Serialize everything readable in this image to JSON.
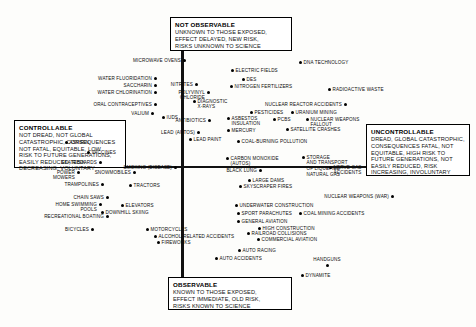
{
  "figure": {
    "type": "scatter",
    "title": "",
    "xlabel": "Controllable – Uncontrollable (Dread) factor",
    "ylabel": "Observable – Not Observable (Unknown) factor",
    "axes": {
      "vertical": "unknown-risk-axis",
      "horizontal": "dread-risk-axis"
    },
    "grid": false,
    "legend": false
  },
  "quadrant_labels": {
    "not_observable": {
      "title": "NOT OBSERVABLE",
      "body": "UNKNOWN TO THOSE EXPOSED,\nEFFECT DELAYED, NEW RISK,\nRISKS UNKNOWN TO SCIENCE"
    },
    "observable": {
      "title": "OBSERVABLE",
      "body": "KNOWN TO THOSE EXPOSED,\nEFFECT IMMEDIATE, OLD RISK,\nRISKS KNOWN TO SCIENCE"
    },
    "controllable": {
      "title": "CONTROLLABLE",
      "body": "NOT DREAD, NOT GLOBAL\nCATASTROPHIC, CONSEQUENCES\nNOT FATAL, EQUITABLE, LOW\nRISK TO FUTURE GENERATIONS,\nEASILY REDUCED, RISK\nDECREASING, VOLUNTARY"
    },
    "uncontrollable": {
      "title": "UNCONTROLLABLE",
      "body": "DREAD, GLOBAL CATASTROPHIC,\nCONSEQUENCES FATAL, NOT\nEQUITABLE, HIGH RISK TO\nFUTURE GENERATIONS, NOT\nEASILY REDUCED, RISK\nINCREASING, INVOLUNTARY"
    }
  },
  "chart_data": {
    "type": "scatter",
    "title": "",
    "xlabel": "Controllable → Uncontrollable (Dread)",
    "ylabel": "Observable → Not Observable (Unknown)",
    "xlim": [
      0,
      476
    ],
    "ylim": [
      0,
      327
    ],
    "points": [
      {
        "label": "MICROWAVE OVENS",
        "x": 184,
        "y": 60,
        "align": "right"
      },
      {
        "label": "WATER FLUORIDATION",
        "x": 155,
        "y": 78,
        "align": "right"
      },
      {
        "label": "SACCHARIN",
        "x": 155,
        "y": 85,
        "align": "right"
      },
      {
        "label": "WATER CHLORINATION",
        "x": 155,
        "y": 92,
        "align": "right"
      },
      {
        "label": "ORAL CONTRACEPTIVES",
        "x": 155,
        "y": 104,
        "align": "right"
      },
      {
        "label": "VALIUM",
        "x": 152,
        "y": 113,
        "align": "right"
      },
      {
        "label": "IUDS",
        "x": 163,
        "y": 117,
        "align": "left"
      },
      {
        "label": "NITRITES",
        "x": 196,
        "y": 84,
        "align": "right"
      },
      {
        "label": "POLYVINYL\nCHLORIDE",
        "x": 208,
        "y": 92,
        "align": "right"
      },
      {
        "label": "DIAGNOSTIC\nX-RAYS",
        "x": 194,
        "y": 101,
        "align": "left"
      },
      {
        "label": "ANTIBIOTICS",
        "x": 209,
        "y": 120,
        "align": "right"
      },
      {
        "label": "DNA TECHNOLOGY",
        "x": 300,
        "y": 62,
        "align": "left"
      },
      {
        "label": "ELECTRIC FIELDS",
        "x": 232,
        "y": 70,
        "align": "left"
      },
      {
        "label": "DES",
        "x": 243,
        "y": 79,
        "align": "left"
      },
      {
        "label": "NITROGEN FERTILIZERS",
        "x": 231,
        "y": 86,
        "align": "left"
      },
      {
        "label": "RADIOACTIVE WASTE",
        "x": 329,
        "y": 89,
        "align": "left"
      },
      {
        "label": "NUCLEAR REACTOR ACCIDENTS",
        "x": 345,
        "y": 104,
        "align": "right"
      },
      {
        "label": "PESTICIDES",
        "x": 251,
        "y": 112,
        "align": "left"
      },
      {
        "label": "URANIUM MINING",
        "x": 292,
        "y": 112,
        "align": "left"
      },
      {
        "label": "ASBESTOS\nINSULATION",
        "x": 228,
        "y": 118,
        "align": "left"
      },
      {
        "label": "PCBS",
        "x": 274,
        "y": 119,
        "align": "left"
      },
      {
        "label": "NUCLEAR WEAPONS\nFALLOUT",
        "x": 307,
        "y": 119,
        "align": "left"
      },
      {
        "label": "MERCURY",
        "x": 228,
        "y": 130,
        "align": "left"
      },
      {
        "label": "SATELLITE CRASHES",
        "x": 287,
        "y": 129,
        "align": "left"
      },
      {
        "label": "COAL-BURNING POLLUTION",
        "x": 238,
        "y": 141,
        "align": "left"
      },
      {
        "label": "LEAD (AUTOS)",
        "x": 198,
        "y": 132,
        "align": "right"
      },
      {
        "label": "LEAD PAINT",
        "x": 190,
        "y": 139,
        "align": "left"
      },
      {
        "label": "ASPIRIN",
        "x": 66,
        "y": 142,
        "align": "left"
      },
      {
        "label": "VACCINES",
        "x": 88,
        "y": 152,
        "align": "left"
      },
      {
        "label": "SKATEBOARDS",
        "x": 100,
        "y": 162,
        "align": "right"
      },
      {
        "label": "POWER\nMOWERS",
        "x": 78,
        "y": 172,
        "align": "right"
      },
      {
        "label": "SNOWMOBILES",
        "x": 134,
        "y": 172,
        "align": "right"
      },
      {
        "label": "SMOKING (DISEASE)",
        "x": 175,
        "y": 167,
        "align": "right"
      },
      {
        "label": "TRAMPOLINES",
        "x": 102,
        "y": 184,
        "align": "right"
      },
      {
        "label": "TRACTORS",
        "x": 130,
        "y": 185,
        "align": "left"
      },
      {
        "label": "CHAIN SAWS",
        "x": 107,
        "y": 197,
        "align": "right"
      },
      {
        "label": "HOME SWIMMING\nPOOLS",
        "x": 100,
        "y": 204,
        "align": "right"
      },
      {
        "label": "DOWNHILL SKIING",
        "x": 102,
        "y": 212,
        "align": "left"
      },
      {
        "label": "RECREATIONAL BOATING",
        "x": 107,
        "y": 216,
        "align": "right"
      },
      {
        "label": "ELEVATORS",
        "x": 122,
        "y": 205,
        "align": "left"
      },
      {
        "label": "BICYCLES",
        "x": 92,
        "y": 229,
        "align": "right"
      },
      {
        "label": "MOTORCYCLES",
        "x": 147,
        "y": 229,
        "align": "left"
      },
      {
        "label": "ALCOHOL-RELATED ACCIDENTS",
        "x": 155,
        "y": 236,
        "align": "left"
      },
      {
        "label": "FIREWORKS",
        "x": 158,
        "y": 242,
        "align": "left"
      },
      {
        "label": "CARBON MONOXIDE\n(AUTOS)",
        "x": 227,
        "y": 158,
        "align": "left"
      },
      {
        "label": "BLACK LUNG",
        "x": 260,
        "y": 170,
        "align": "right"
      },
      {
        "label": "LARGE DAMS",
        "x": 249,
        "y": 180,
        "align": "left"
      },
      {
        "label": "SKYSCRAPER FIRES",
        "x": 240,
        "y": 186,
        "align": "left"
      },
      {
        "label": "STORAGE\nAND TRANSPORT\nOF LIQUEFIED\nNATURAL GAS",
        "x": 303,
        "y": 157,
        "align": "left"
      },
      {
        "label": "NERVE GAS\nACCIDENTS",
        "x": 330,
        "y": 167,
        "align": "left"
      },
      {
        "label": "NUCLEAR WEAPONS (WAR)",
        "x": 392,
        "y": 196,
        "align": "right"
      },
      {
        "label": "UNDERWATER CONSTRUCTION",
        "x": 236,
        "y": 205,
        "align": "left"
      },
      {
        "label": "SPORT PARACHUTES",
        "x": 238,
        "y": 213,
        "align": "left"
      },
      {
        "label": "COAL MINING ACCIDENTS",
        "x": 300,
        "y": 213,
        "align": "left"
      },
      {
        "label": "GENERAL AVIATION",
        "x": 238,
        "y": 221,
        "align": "left"
      },
      {
        "label": "HIGH CONSTRUCTION",
        "x": 259,
        "y": 228,
        "align": "left"
      },
      {
        "label": "RAILROAD COLLISIONS",
        "x": 248,
        "y": 233,
        "align": "left"
      },
      {
        "label": "COMMERCIAL AVIATION",
        "x": 258,
        "y": 239,
        "align": "left"
      },
      {
        "label": "AUTO RACING",
        "x": 239,
        "y": 250,
        "align": "left"
      },
      {
        "label": "AUTO ACCIDENTS",
        "x": 216,
        "y": 258,
        "align": "left"
      },
      {
        "label": "HANDGUNS",
        "x": 327,
        "y": 265,
        "align": "center"
      },
      {
        "label": "DYNAMITE",
        "x": 302,
        "y": 275,
        "align": "left"
      }
    ]
  }
}
